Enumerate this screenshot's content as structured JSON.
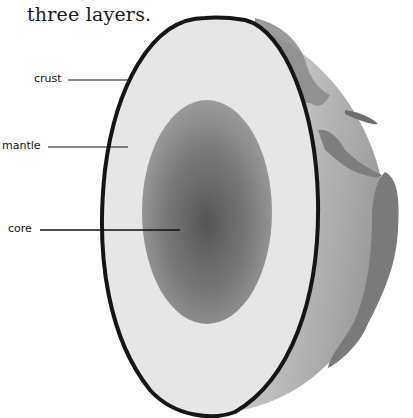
{
  "caption": {
    "top_cutoff": "Earth is made up of three layers.",
    "line": "three layers."
  },
  "diagram": {
    "labels": [
      {
        "id": "crust",
        "text": "crust"
      },
      {
        "id": "mantle",
        "text": "mantle"
      },
      {
        "id": "core",
        "text": "core"
      }
    ],
    "colors": {
      "crust_outline": "#151515",
      "mantle": "#e4e4e4",
      "core_outer": "#9a9a9a",
      "core_inner": "#5a5a5a",
      "globe_ocean": "#b8b8b8",
      "globe_land": "#7a7a7a",
      "background": "#ffffff"
    }
  }
}
